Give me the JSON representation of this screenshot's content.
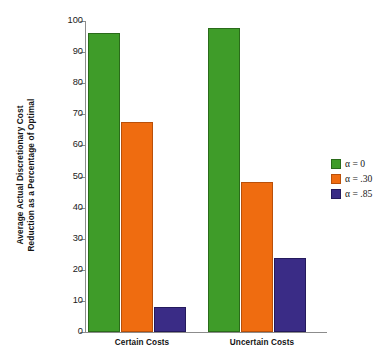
{
  "chart_data": {
    "type": "bar",
    "title": "",
    "xlabel": "",
    "ylabel": "Average Actual Discretionary Cost Reduction as a Percentage of Optimal",
    "ylabel_lines": [
      "Average Actual Discretionary Cost",
      "Reduction as a Percentage of Optimal"
    ],
    "categories": [
      "Certain Costs",
      "Uncertain Costs"
    ],
    "series": [
      {
        "name": "α = 0",
        "values": [
          95.5,
          97.0
        ],
        "color": "#3f9c29"
      },
      {
        "name": "α = .30",
        "values": [
          67.0,
          47.5
        ],
        "color": "#ef6c10"
      },
      {
        "name": "α = .85",
        "values": [
          7.4,
          23.0
        ],
        "color": "#3a2c86"
      }
    ],
    "ylim": [
      0,
      100
    ],
    "ytick_values": [
      0,
      10,
      20,
      30,
      40,
      50,
      60,
      70,
      80,
      90,
      100
    ],
    "ytick_labels": [
      "0",
      "10",
      "20",
      "30",
      "40",
      "50",
      "60",
      "70",
      "80",
      "90",
      "100"
    ],
    "grid": false,
    "legend_position": "right"
  },
  "legend": {
    "entries": [
      {
        "label": "α = 0"
      },
      {
        "label": "α = .30"
      },
      {
        "label": "α = .85"
      }
    ]
  }
}
